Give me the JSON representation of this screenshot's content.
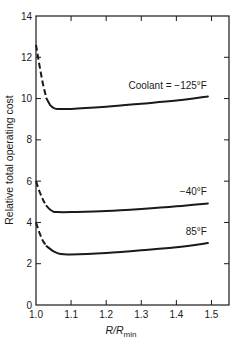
{
  "chart_data": {
    "type": "line",
    "title": "",
    "xlabel": "R/R_min",
    "xlabel_main": "R/R",
    "xlabel_sub": "min",
    "ylabel": "Relative total operating cost",
    "xlim": [
      1.0,
      1.55
    ],
    "ylim": [
      0,
      14
    ],
    "xticks": [
      1.0,
      1.1,
      1.2,
      1.3,
      1.4,
      1.5
    ],
    "xtick_labels": [
      "1.0",
      "1.1",
      "1.2",
      "1.3",
      "1.4",
      "1.5"
    ],
    "yticks": [
      0,
      2,
      4,
      6,
      8,
      10,
      12,
      14
    ],
    "ytick_labels": [
      "0",
      "2",
      "4",
      "6",
      "8",
      "10",
      "12",
      "14"
    ],
    "grid": false,
    "legend": "inline labels at right end of curves",
    "series": [
      {
        "name": "Coolant = −125°F",
        "label": "Coolant = −125°F",
        "dashed_segment": {
          "x": [
            1.0,
            1.01,
            1.02,
            1.03
          ],
          "y": [
            12.6,
            11.6,
            10.7,
            10.0
          ]
        },
        "x": [
          1.03,
          1.04,
          1.05,
          1.06,
          1.1,
          1.2,
          1.3,
          1.4,
          1.49
        ],
        "y": [
          10.0,
          9.7,
          9.55,
          9.5,
          9.5,
          9.6,
          9.75,
          9.9,
          10.1
        ]
      },
      {
        "name": "−40°F",
        "label": "−40°F",
        "dashed_segment": {
          "x": [
            1.0,
            1.01,
            1.02,
            1.03
          ],
          "y": [
            6.0,
            5.5,
            5.1,
            4.8
          ]
        },
        "x": [
          1.03,
          1.04,
          1.05,
          1.06,
          1.1,
          1.2,
          1.3,
          1.4,
          1.49
        ],
        "y": [
          4.8,
          4.62,
          4.52,
          4.5,
          4.5,
          4.55,
          4.65,
          4.78,
          4.92
        ]
      },
      {
        "name": "85°F",
        "label": "85°F",
        "dashed_segment": {
          "x": [
            1.0,
            1.01,
            1.02,
            1.03
          ],
          "y": [
            4.0,
            3.5,
            3.1,
            2.85
          ]
        },
        "x": [
          1.03,
          1.05,
          1.07,
          1.1,
          1.2,
          1.3,
          1.4,
          1.49
        ],
        "y": [
          2.85,
          2.6,
          2.47,
          2.45,
          2.52,
          2.65,
          2.8,
          3.0
        ]
      }
    ]
  }
}
